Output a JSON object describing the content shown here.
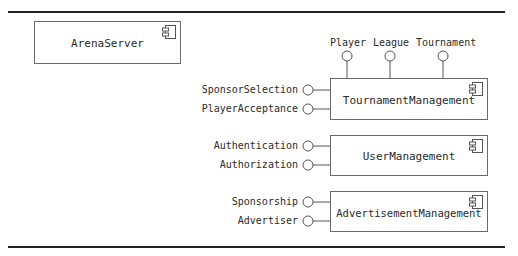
{
  "diagram": {
    "type": "UML component diagram",
    "standalone_component": {
      "name": "ArenaServer"
    },
    "components": [
      {
        "name": "TournamentManagement",
        "provided_interfaces_left": [
          "SponsorSelection",
          "PlayerAcceptance"
        ],
        "provided_interfaces_top": [
          "Player",
          "League",
          "Tournament"
        ]
      },
      {
        "name": "UserManagement",
        "provided_interfaces_left": [
          "Authentication",
          "Authorization"
        ]
      },
      {
        "name": "AdvertisementManagement",
        "provided_interfaces_left": [
          "Sponsorship",
          "Advertiser"
        ]
      }
    ]
  },
  "colors": {
    "line": "#222222",
    "box_border": "#6a6a6a",
    "text": "#2a2a2a"
  }
}
